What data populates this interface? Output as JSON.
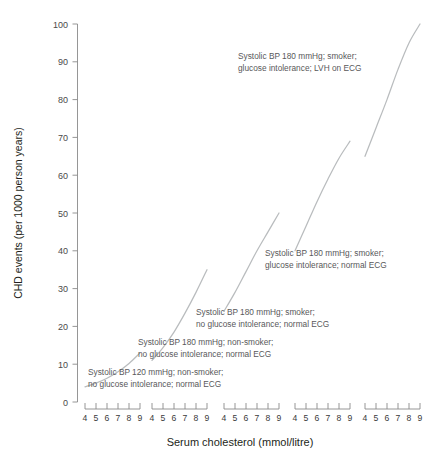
{
  "chart_data": {
    "type": "line",
    "title": "",
    "xlabel": "Serum cholesterol (mmol/litre)",
    "ylabel": "CHD events (per 1000 person years)",
    "ylim": [
      0,
      100
    ],
    "yticks": [
      0,
      10,
      20,
      30,
      40,
      50,
      60,
      70,
      80,
      90,
      100
    ],
    "ytick_labels": [
      "0",
      "10",
      "20",
      "30",
      "40",
      "50",
      "60",
      "70",
      "80",
      "90",
      "100"
    ],
    "xlim": [
      4,
      9
    ],
    "xticks": [
      4,
      5,
      6,
      7,
      8,
      9
    ],
    "xtick_labels": [
      "4",
      "5",
      "6",
      "7",
      "8",
      "9"
    ],
    "panel_count": 5,
    "grid": false,
    "legend_position": "inline-annotations",
    "series": [
      {
        "name": "Systolic BP 120 mmHg; non-smoker; no glucose intolerance; normal ECG",
        "panel": 1,
        "x": [
          4,
          5,
          6,
          7,
          8,
          9
        ],
        "values": [
          4.0,
          5.0,
          6.3,
          8.0,
          10.2,
          13.0
        ]
      },
      {
        "name": "Systolic BP 180 mmHg; non-smoker; no glucose intolerance; normal ECG",
        "panel": 2,
        "x": [
          4,
          5,
          6,
          7,
          8,
          9
        ],
        "values": [
          11.0,
          14.4,
          18.5,
          23.5,
          29.0,
          35.0
        ]
      },
      {
        "name": "Systolic BP 180 mmHg; smoker; no glucose intolerance; normal ECG",
        "panel": 3,
        "x": [
          4,
          5,
          6,
          7,
          8,
          9
        ],
        "values": [
          24.0,
          29.0,
          34.5,
          40.0,
          45.0,
          50.0
        ]
      },
      {
        "name": "Systolic BP 180 mmHg; smoker; glucose intolerance; normal ECG",
        "panel": 4,
        "x": [
          4,
          5,
          6,
          7,
          8,
          9
        ],
        "values": [
          40.0,
          46.5,
          53.0,
          59.0,
          64.5,
          69.0
        ]
      },
      {
        "name": "Systolic BP 180 mmHg; smoker; glucose intolerance; LVH on ECG",
        "panel": 5,
        "x": [
          4,
          5,
          6,
          7,
          8,
          9
        ],
        "values": [
          65.0,
          72.5,
          80.0,
          88.0,
          95.0,
          100.0
        ]
      }
    ],
    "annotations": [
      {
        "id": "annotation-lvh-ecg",
        "line1": "Systolic BP 180 mmHg; smoker;",
        "line2": "glucose intolerance; LVH on ECG"
      },
      {
        "id": "annotation-glucose-normal-ecg",
        "line1": "Systolic BP 180 mmHg; smoker;",
        "line2": "glucose intolerance; normal ECG"
      },
      {
        "id": "annotation-smoker-normal-ecg",
        "line1": "Systolic BP 180 mmHg; smoker;",
        "line2": "no glucose intolerance; normal ECG"
      },
      {
        "id": "annotation-bp180-nonsmoker",
        "line1": "Systolic BP 180 mmHg; non-smoker;",
        "line2": "no glucose intolerance; normal ECG"
      },
      {
        "id": "annotation-bp120-nonsmoker",
        "line1": "Systolic BP 120 mmHg; non-smoker;",
        "line2": "no glucose intolerance; normal ECG"
      }
    ],
    "colors": {
      "curve": "#b9bcbe",
      "axis": "#8a8a8a",
      "text": "#231f20",
      "annotation_text": "#58585a"
    }
  }
}
